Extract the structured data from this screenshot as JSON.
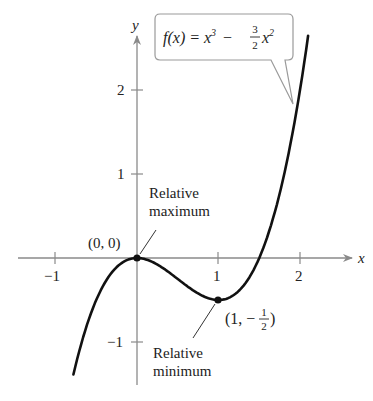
{
  "chart_data": {
    "type": "line",
    "function_label": {
      "prefix": "f(x) = x",
      "exp1": "3",
      "minus": "−",
      "frac_num": "3",
      "frac_den": "2",
      "var": "x",
      "exp2": "2"
    },
    "xlabel": "x",
    "ylabel": "y",
    "xlim": [
      -1.0,
      2.5
    ],
    "ylim": [
      -1.55,
      2.6
    ],
    "x_ticks": [
      {
        "value": -1,
        "label": "−1"
      },
      {
        "value": 1,
        "label": "1"
      },
      {
        "value": 2,
        "label": "2"
      }
    ],
    "y_ticks": [
      {
        "value": 2,
        "label": "2"
      },
      {
        "value": 1,
        "label": "1"
      },
      {
        "value": -1,
        "label": "−1"
      }
    ],
    "grid": false,
    "series": [
      {
        "name": "f(x)",
        "x": [
          -0.78,
          -0.6,
          -0.4,
          -0.2,
          0,
          0.2,
          0.4,
          0.6,
          0.8,
          1.0,
          1.2,
          1.4,
          1.6,
          1.8,
          2.0,
          2.1
        ],
        "values": [
          -1.387,
          -0.756,
          -0.304,
          -0.068,
          0,
          -0.052,
          -0.176,
          -0.324,
          -0.448,
          -0.5,
          -0.432,
          -0.196,
          0.256,
          0.972,
          2.0,
          2.646
        ]
      }
    ],
    "annotations": [
      {
        "point": [
          0,
          0
        ],
        "coord_label": "(0, 0)",
        "text_line1": "Relative",
        "text_line2": "maximum"
      },
      {
        "point": [
          1,
          -0.5
        ],
        "coord_label_prefix": "(1, −",
        "coord_label_num": "1",
        "coord_label_den": "2",
        "coord_label_suffix": ")",
        "text_line1": "Relative",
        "text_line2": "minimum"
      }
    ]
  },
  "colors": {
    "curve": "#111111",
    "axis": "#8a8a8a",
    "text": "#222222",
    "callout_border": "#9a9a9a"
  }
}
